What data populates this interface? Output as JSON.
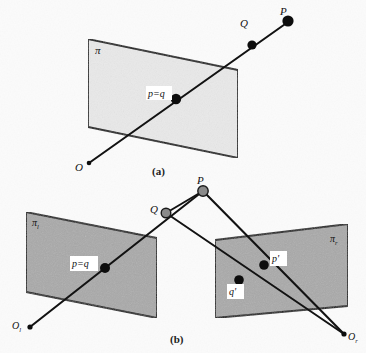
{
  "figure": {
    "colors": {
      "background": "#fbfbfb",
      "plane_a_fill": "#e9e9e9",
      "plane_b_fill": "#a9a9a9",
      "outline": "#1a1a1a",
      "ray": "#121212",
      "solid_dot": "#0d0d0d",
      "gray_dot": "#8a8a8a",
      "label_box": "#ffffff"
    },
    "panels": [
      {
        "id": "a",
        "caption": "(a)",
        "plane_label": "π",
        "points": [
          {
            "name": "P",
            "label": "P"
          },
          {
            "name": "Q",
            "label": "Q"
          },
          {
            "name": "pq",
            "label": "p=q"
          },
          {
            "name": "O",
            "label": "O"
          }
        ]
      },
      {
        "id": "b",
        "caption": "(b)",
        "plane_label_left": "π",
        "plane_label_left_sub": "l",
        "plane_label_right": "π",
        "plane_label_right_sub": "r",
        "points": [
          {
            "name": "P",
            "label": "P"
          },
          {
            "name": "Q",
            "label": "Q"
          },
          {
            "name": "pq",
            "label": "p=q"
          },
          {
            "name": "pprime",
            "label": "p'"
          },
          {
            "name": "qprime",
            "label": "q'"
          },
          {
            "name": "Ol",
            "label": "O",
            "sub": "l"
          },
          {
            "name": "Or",
            "label": "O",
            "sub": "r"
          }
        ]
      }
    ]
  }
}
